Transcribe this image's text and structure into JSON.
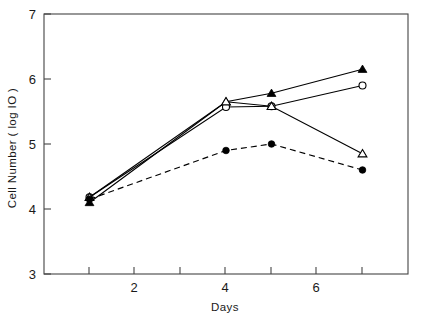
{
  "chart_data": {
    "type": "line",
    "title": "",
    "xlabel": "Days",
    "ylabel": "Cell Number ( log IO )",
    "xlim": [
      0,
      8
    ],
    "ylim": [
      3,
      7
    ],
    "xticks": [
      1,
      2,
      3,
      4,
      5,
      6,
      7
    ],
    "xtick_labels": [
      "",
      "2",
      "",
      "4",
      "",
      "6",
      ""
    ],
    "yticks": [
      3,
      4,
      5,
      6,
      7
    ],
    "ytick_labels": [
      "3",
      "4",
      "5",
      "6",
      "7"
    ],
    "grid": false,
    "legend": "none",
    "x": [
      1,
      4,
      5,
      7
    ],
    "series": [
      {
        "name": "filled-triangle-series",
        "marker": "filled-triangle",
        "linestyle": "solid",
        "values": [
          4.1,
          5.65,
          5.78,
          6.15
        ]
      },
      {
        "name": "open-circle-series",
        "marker": "open-circle",
        "linestyle": "solid",
        "values": [
          4.18,
          5.57,
          5.58,
          5.9
        ]
      },
      {
        "name": "open-triangle-series",
        "marker": "open-triangle",
        "linestyle": "solid",
        "values": [
          4.18,
          5.65,
          5.58,
          4.85
        ]
      },
      {
        "name": "filled-circle-series",
        "marker": "filled-circle",
        "linestyle": "dashed",
        "values": [
          4.15,
          4.9,
          5.0,
          4.6
        ]
      }
    ]
  },
  "axes": {
    "y_title": "Cell Number ( log IO )",
    "x_title": "Days",
    "y_labels": {
      "t7": "7",
      "t6": "6",
      "t5": "5",
      "t4": "4",
      "t3": "3"
    },
    "x_labels": {
      "t2": "2",
      "t4": "4",
      "t6": "6"
    }
  },
  "colors": {
    "line": "#000000",
    "frame": "#444444",
    "background": "#ffffff",
    "text": "#1a1a1a"
  }
}
